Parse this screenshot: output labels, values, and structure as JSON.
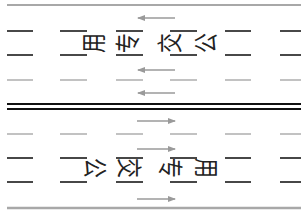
{
  "diagram": {
    "colors": {
      "background": "#ffffff",
      "edge_line": "#a8a8a8",
      "lane_dash_black": "#1a1a1a",
      "lane_dash_gray": "#a8a8a8",
      "center_line": "#111111",
      "arrow": "#9a9a9a",
      "text": "#222222"
    },
    "upper_carriageway": {
      "direction": "left",
      "marking_text": [
        "公",
        "交",
        "专",
        "用"
      ],
      "marking_label": "公交专用",
      "arrows_y": [
        18,
        70,
        93
      ]
    },
    "lower_carriageway": {
      "direction": "right",
      "marking_text": [
        "公",
        "交",
        "专",
        "用"
      ],
      "marking_label": "公交专用",
      "arrows_y": [
        121,
        149,
        199
      ]
    },
    "lines": {
      "top_edge_y": 5,
      "upper_black_dash_y": [
        31,
        55
      ],
      "upper_gray_dash_y": 80,
      "center_double_y": [
        104,
        109
      ],
      "lower_gray_dash_y": 134,
      "lower_black_dash_y": [
        158,
        182
      ],
      "bottom_edge_y": 208,
      "dash_segments_x": [
        [
          7,
          33
        ],
        [
          60,
          87
        ],
        [
          116,
          143
        ],
        [
          170,
          197
        ],
        [
          225,
          251
        ],
        [
          280,
          301
        ]
      ]
    }
  }
}
